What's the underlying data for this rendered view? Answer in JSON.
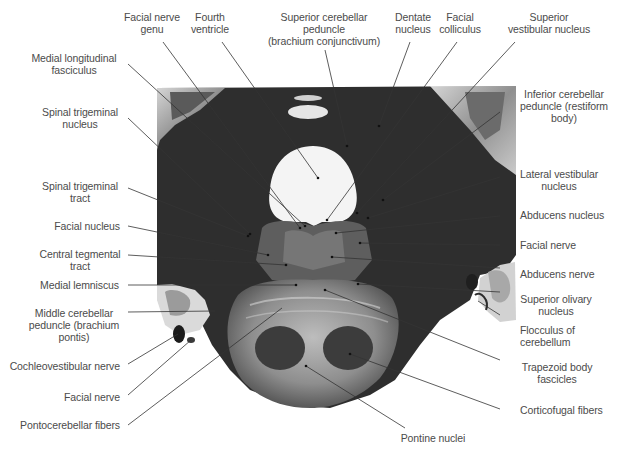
{
  "figure": {
    "colors": {
      "background": "#ffffff",
      "label_text": "#4b4b4b",
      "leader_line": "#3a3a3a",
      "specimen_dark": "#2b2b2b"
    }
  },
  "labels": {
    "top": [
      {
        "id": "facial-nerve-genu",
        "lines": [
          "Facial nerve",
          "genu"
        ]
      },
      {
        "id": "fourth-ventricle",
        "lines": [
          "Fourth",
          "ventricle"
        ]
      },
      {
        "id": "superior-cerebellar-peduncle",
        "lines": [
          "Superior cerebellar",
          "peduncle",
          "(brachium conjunctivum)"
        ]
      },
      {
        "id": "dentate-nucleus",
        "lines": [
          "Dentate",
          "nucleus"
        ]
      },
      {
        "id": "facial-colliculus",
        "lines": [
          "Facial",
          "colliculus"
        ]
      },
      {
        "id": "superior-vestibular-nucleus",
        "lines": [
          "Superior",
          "vestibular nucleus"
        ]
      }
    ],
    "left": [
      {
        "id": "medial-longitudinal-fasciculus",
        "lines": [
          "Medial longitudinal",
          "fasciculus"
        ]
      },
      {
        "id": "spinal-trigeminal-nucleus",
        "lines": [
          "Spinal trigeminal",
          "nucleus"
        ]
      },
      {
        "id": "spinal-trigeminal-tract",
        "lines": [
          "Spinal trigeminal",
          "tract"
        ]
      },
      {
        "id": "facial-nucleus",
        "lines": [
          "Facial nucleus"
        ]
      },
      {
        "id": "central-tegmental-tract",
        "lines": [
          "Central tegmental",
          "tract"
        ]
      },
      {
        "id": "medial-lemniscus",
        "lines": [
          "Medial lemniscus"
        ]
      },
      {
        "id": "middle-cerebellar-peduncle",
        "lines": [
          "Middle cerebellar",
          "peduncle (brachium",
          "pontis)"
        ]
      },
      {
        "id": "cochleovestibular-nerve",
        "lines": [
          "Cochleovestibular nerve"
        ]
      },
      {
        "id": "facial-nerve-left",
        "lines": [
          "Facial nerve"
        ]
      },
      {
        "id": "pontocerebellar-fibers",
        "lines": [
          "Pontocerebellar fibers"
        ]
      }
    ],
    "right": [
      {
        "id": "inferior-cerebellar-peduncle",
        "lines": [
          "Inferior cerebellar",
          "peduncle (restiform",
          "body)"
        ]
      },
      {
        "id": "lateral-vestibular-nucleus",
        "lines": [
          "Lateral vestibular",
          "nucleus"
        ]
      },
      {
        "id": "abducens-nucleus",
        "lines": [
          "Abducens nucleus"
        ]
      },
      {
        "id": "facial-nerve-right",
        "lines": [
          "Facial nerve"
        ]
      },
      {
        "id": "abducens-nerve",
        "lines": [
          "Abducens nerve"
        ]
      },
      {
        "id": "superior-olivary-nucleus",
        "lines": [
          "Superior olivary",
          "nucleus"
        ]
      },
      {
        "id": "flocculus-of-cerebellum",
        "lines": [
          "Flocculus of",
          "cerebellum"
        ]
      },
      {
        "id": "trapezoid-body-fascicles",
        "lines": [
          "Trapezoid body",
          "fascicles"
        ]
      },
      {
        "id": "corticofugal-fibers",
        "lines": [
          "Corticofugal fibers"
        ]
      }
    ],
    "bottom": [
      {
        "id": "pontine-nuclei",
        "lines": [
          "Pontine nuclei"
        ]
      }
    ]
  }
}
